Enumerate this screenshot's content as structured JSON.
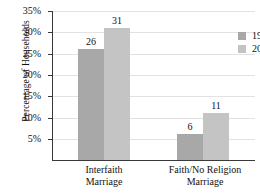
{
  "chart_data": {
    "type": "bar",
    "title": "",
    "xlabel": "",
    "ylabel": "Percentage of Households",
    "categories": [
      "Interfaith Marriage",
      "Faith/No Religion Marriage"
    ],
    "category_lines": [
      [
        "Interfaith",
        "Marriage"
      ],
      [
        "Faith/No Religion",
        "Marriage"
      ]
    ],
    "series": [
      {
        "name": "1988",
        "values": [
          26,
          31
        ],
        "color": "#a8a8a8"
      },
      {
        "name": "2008",
        "values": [
          31,
          11
        ],
        "color": "#c4c4c4"
      }
    ],
    "bars": [
      {
        "group": "Interfaith Marriage",
        "series": "1988",
        "value": 26,
        "label": "26"
      },
      {
        "group": "Interfaith Marriage",
        "series": "2008",
        "value": 31,
        "label": "31"
      },
      {
        "group": "Faith/No Religion Marriage",
        "series": "1988",
        "value": 6,
        "label": "6"
      },
      {
        "group": "Faith/No Religion Marriage",
        "series": "2008",
        "value": 11,
        "label": "11"
      }
    ],
    "ylim": [
      0,
      35
    ],
    "ytick_values": [
      5,
      10,
      15,
      20,
      25,
      30,
      35
    ],
    "ytick_labels": [
      "5%",
      "10%",
      "15%",
      "20%",
      "25%",
      "30%",
      "35%"
    ],
    "grid": true,
    "legend_position": "top-right",
    "legend": [
      {
        "label": "1988",
        "color": "#a8a8a8"
      },
      {
        "label": "2008",
        "color": "#c4c4c4"
      }
    ]
  }
}
